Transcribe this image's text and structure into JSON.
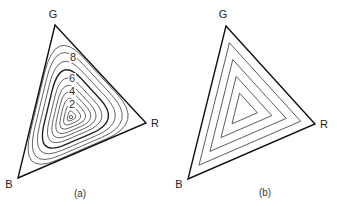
{
  "panels": [
    {
      "id": "a",
      "caption": "(a)",
      "vertices": {
        "G": {
          "label": "G",
          "x": 55,
          "y": 25,
          "lx": 53,
          "ly": 18
        },
        "R": {
          "label": "R",
          "x": 146,
          "y": 123,
          "lx": 155,
          "ly": 127
        },
        "B": {
          "label": "B",
          "x": 18,
          "y": 178,
          "lx": 9,
          "ly": 188
        }
      },
      "center": {
        "x": 71,
        "y": 117
      },
      "contour_scales": [
        0.09,
        0.18,
        0.27,
        0.36,
        0.45,
        0.55,
        0.66,
        0.77,
        0.88,
        0.97
      ],
      "bold_contour_index": 6,
      "contour_labels": [
        {
          "text": "2",
          "x": 72,
          "y": 108
        },
        {
          "text": "4",
          "x": 72,
          "y": 95
        },
        {
          "text": "6",
          "x": 72,
          "y": 82
        },
        {
          "text": "8",
          "x": 73,
          "y": 61
        }
      ],
      "center_marker": "small-circle"
    },
    {
      "id": "b",
      "caption": "(b)",
      "vertices": {
        "G": {
          "label": "G",
          "x": 226,
          "y": 26,
          "lx": 223,
          "ly": 18
        },
        "R": {
          "label": "R",
          "x": 315,
          "y": 124,
          "lx": 324,
          "ly": 128
        },
        "B": {
          "label": "B",
          "x": 188,
          "y": 179,
          "lx": 179,
          "ly": 188
        }
      },
      "center": {
        "x": 243,
        "y": 110
      },
      "nested_scales": [
        0.8,
        0.6,
        0.4,
        0.2
      ]
    }
  ],
  "captions": {
    "a": "(a)",
    "b": "(b)"
  },
  "labels": {
    "G": "G",
    "R": "R",
    "B": "B"
  }
}
